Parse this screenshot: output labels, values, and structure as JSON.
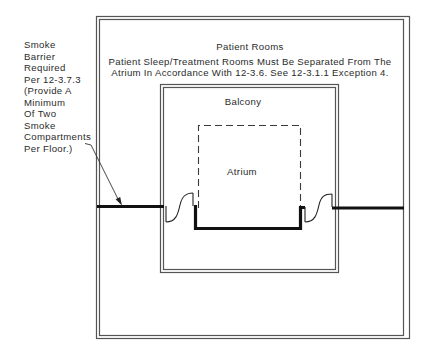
{
  "diagram": {
    "type": "floor-plan",
    "labels": {
      "outer_zone": "Patient Rooms",
      "middle_zone": "Balcony",
      "inner_zone": "Atrium"
    },
    "note": {
      "line1": "Patient Sleep/Treatment Rooms Must Be Separated From The",
      "line2": "Atrium In Accordance With 12-3.6. See 12-3.1.1 Exception 4."
    },
    "callout": {
      "lines": [
        "Smoke",
        "Barrier",
        "Required",
        "Per 12-3.7.3",
        "(Provide A",
        "Minimum",
        "Of Two",
        "Smoke",
        "Compartments",
        "Per Floor.)"
      ],
      "target": "smoke-barrier"
    },
    "elements": [
      {
        "id": "patient-rooms-boundary",
        "style": "double-line"
      },
      {
        "id": "balcony-boundary",
        "style": "double-line"
      },
      {
        "id": "atrium-opening",
        "style": "dashed"
      },
      {
        "id": "smoke-barrier",
        "style": "thick-line"
      },
      {
        "id": "smoke-door-left",
        "style": "door-swing"
      },
      {
        "id": "smoke-door-right",
        "style": "door-swing"
      }
    ],
    "colors": {
      "line": "#3a3a3a",
      "double_line": "#5a5a5a",
      "barrier": "#111111",
      "background": "#ffffff"
    }
  }
}
